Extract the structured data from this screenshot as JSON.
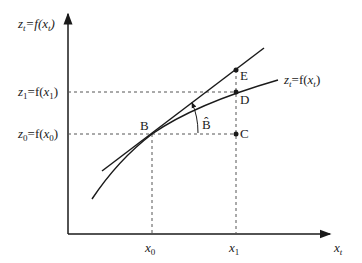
{
  "axes": {
    "y_label": {
      "base": "z",
      "sub": "t",
      "eq": "=f(",
      "arg": "x",
      "arg_sub": "t",
      "close": ")"
    },
    "x_label": {
      "base": "x",
      "sub": "t"
    }
  },
  "ticks": {
    "x0": {
      "base": "x",
      "sub": "0"
    },
    "x1": {
      "base": "x",
      "sub": "1"
    },
    "z0": {
      "base": "z",
      "sub": "0",
      "eq": "=f(",
      "arg": "x",
      "arg_sub": "0",
      "close": ")"
    },
    "z1": {
      "base": "z",
      "sub": "1",
      "eq": "=f(",
      "arg": "x",
      "arg_sub": "1",
      "close": ")"
    }
  },
  "curve_label": {
    "base": "z",
    "sub": "t",
    "eq": "=f(",
    "arg": "x",
    "arg_sub": "t",
    "close": ")"
  },
  "points": {
    "B": "B",
    "C": "C",
    "D": "D",
    "E": "E"
  },
  "angle_label": "B̂",
  "colors": {
    "line": "#1a1a1a",
    "dashed": "#555555"
  }
}
